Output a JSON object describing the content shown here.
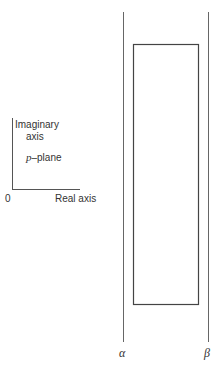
{
  "diagram": {
    "axes": {
      "y_label_line1": "Imaginary",
      "y_label_line2": "axis",
      "x_label": "Real axis",
      "origin_label": "0",
      "plane_label_var": "p",
      "plane_label_rest": "–plane"
    },
    "strip": {
      "left_line_label": "α",
      "right_line_label": "β"
    },
    "colors": {
      "stroke": "#555555"
    }
  }
}
